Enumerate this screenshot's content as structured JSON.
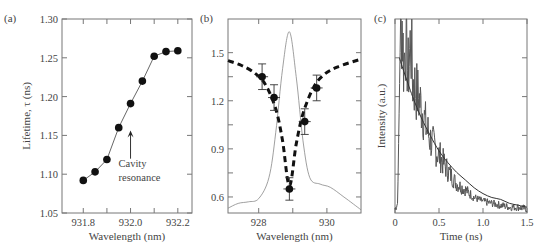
{
  "figure": {
    "panels": [
      {
        "id": "a",
        "label": "(a)"
      },
      {
        "id": "b",
        "label": "(b)"
      },
      {
        "id": "c",
        "label": "(c)"
      }
    ]
  },
  "chart_data": [
    {
      "panel": "(a)",
      "type": "line",
      "title": "",
      "xlabel": "Wavelength (nm)",
      "ylabel": "Lifetime, τ (ns)",
      "xlim": [
        931.7,
        932.25
      ],
      "ylim": [
        1.05,
        1.3
      ],
      "xticks": [
        "931.8",
        "932.0",
        "932.2"
      ],
      "yticks": [
        "1.05",
        "1.10",
        "1.15",
        "1.20",
        "1.25",
        "1.30"
      ],
      "grid": false,
      "series": [
        {
          "name": "Lifetime",
          "marker": "filled-circle",
          "x": [
            931.8,
            931.85,
            931.9,
            931.95,
            932.0,
            932.05,
            932.1,
            932.15,
            932.2
          ],
          "values": [
            1.092,
            1.103,
            1.119,
            1.16,
            1.191,
            1.22,
            1.252,
            1.258,
            1.259
          ]
        }
      ],
      "annotations": [
        {
          "text": "Cavity",
          "text2": "resonance",
          "arrow_x": 932.0,
          "arrow_y_from": 1.12,
          "arrow_y_to": 1.155
        }
      ]
    },
    {
      "panel": "(b)",
      "type": "scatter",
      "title": "",
      "xlabel": "Wavelength (nm)",
      "ylabel": "",
      "xlim": [
        927.1,
        931.0
      ],
      "ylim": [
        0.5,
        1.71
      ],
      "xticks": [
        "928",
        "930"
      ],
      "yticks": [
        "0.6",
        "0.9",
        "1.2",
        "1.5"
      ],
      "grid": false,
      "series": [
        {
          "name": "Measured lifetime",
          "marker": "filled-circle-errorbar",
          "x": [
            928.1,
            928.45,
            928.9,
            929.35,
            929.7
          ],
          "values": [
            1.35,
            1.22,
            0.65,
            1.07,
            1.28
          ],
          "error": [
            0.08,
            0.08,
            0.07,
            0.08,
            0.08
          ]
        },
        {
          "name": "Lorentzian fit",
          "style": "dashed-thick",
          "x": [
            927.1,
            927.5,
            927.9,
            928.2,
            928.5,
            928.7,
            928.9,
            929.1,
            929.3,
            929.6,
            929.9,
            930.3,
            931.0
          ],
          "values": [
            1.45,
            1.42,
            1.37,
            1.3,
            1.15,
            0.95,
            0.67,
            0.93,
            1.12,
            1.28,
            1.36,
            1.41,
            1.46
          ]
        },
        {
          "name": "PL spectrum",
          "style": "thin-solid",
          "x": [
            927.1,
            927.4,
            927.7,
            928.0,
            928.3,
            928.5,
            928.7,
            928.9,
            929.1,
            929.3,
            929.5,
            929.8,
            930.1,
            930.5,
            931.0
          ],
          "values": [
            0.53,
            0.56,
            0.57,
            0.59,
            0.72,
            1.0,
            1.4,
            1.63,
            1.35,
            0.95,
            0.72,
            0.68,
            0.66,
            0.6,
            0.52
          ]
        }
      ]
    },
    {
      "panel": "(c)",
      "type": "line",
      "title": "",
      "xlabel": "Time (ns)",
      "ylabel": "Intensity (a.u.)",
      "xlim": [
        0,
        1.5
      ],
      "ylim": [
        0,
        1.0
      ],
      "xticks": [
        "0",
        "0.5",
        "1.0",
        "1.5"
      ],
      "yticks": [],
      "grid": false,
      "series": [
        {
          "name": "Time-resolved PL (noisy)",
          "x": [
            0,
            0.03,
            0.06,
            0.08,
            0.1,
            0.12,
            0.15,
            0.18,
            0.2,
            0.25,
            0.3,
            0.35,
            0.4,
            0.5,
            0.6,
            0.7,
            0.8,
            0.9,
            1.0,
            1.1,
            1.2,
            1.3,
            1.4,
            1.5
          ],
          "values": [
            0.02,
            0.05,
            0.9,
            1.0,
            0.75,
            0.92,
            0.72,
            0.9,
            0.68,
            0.62,
            0.55,
            0.45,
            0.38,
            0.3,
            0.22,
            0.15,
            0.12,
            0.08,
            0.06,
            0.05,
            0.04,
            0.03,
            0.03,
            0.02
          ]
        },
        {
          "name": "Exponential fit",
          "x": [
            0.05,
            0.1,
            0.2,
            0.3,
            0.4,
            0.5,
            0.6,
            0.7,
            0.8,
            0.9,
            1.0,
            1.1,
            1.2,
            1.3,
            1.4,
            1.5
          ],
          "values": [
            0.8,
            0.73,
            0.6,
            0.49,
            0.4,
            0.32,
            0.26,
            0.21,
            0.17,
            0.13,
            0.1,
            0.08,
            0.07,
            0.05,
            0.04,
            0.03
          ]
        }
      ]
    }
  ]
}
